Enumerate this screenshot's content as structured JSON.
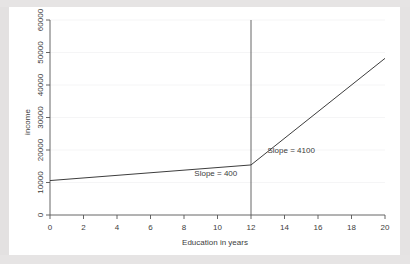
{
  "chart_data": {
    "type": "line",
    "title": "",
    "xlabel": "Education in years",
    "ylabel": "income",
    "xlim": [
      0,
      20
    ],
    "ylim": [
      0,
      60000
    ],
    "xticks": [
      0,
      2,
      4,
      6,
      8,
      10,
      12,
      14,
      16,
      18,
      20
    ],
    "xtick_labels": [
      "0",
      "2",
      "4",
      "6",
      "8",
      "10",
      "12",
      "14",
      "16",
      "18",
      "20"
    ],
    "yticks": [
      0,
      10000,
      20000,
      30000,
      40000,
      50000,
      60000
    ],
    "ytick_labels": [
      "0",
      "10000",
      "20000",
      "30000",
      "40000",
      "50000",
      "60000"
    ],
    "ytick_label_rotation": 90,
    "grid": "faint-horizontal",
    "legend": "none",
    "series": [
      {
        "name": "piecewise-income-spline",
        "color": "#3d3d3d",
        "x": [
          0,
          12,
          20
        ],
        "values": [
          10600,
          15400,
          48200
        ],
        "segments": [
          {
            "name": "pre-high-school",
            "x_from": 0,
            "x_to": 12,
            "slope": 400,
            "y_from": 10600,
            "y_to": 15400
          },
          {
            "name": "post-high-school",
            "x_from": 12,
            "x_to": 20,
            "slope": 4100,
            "y_from": 15400,
            "y_to": 48200
          }
        ]
      }
    ],
    "reference_lines": [
      {
        "name": "knot-at-12",
        "orientation": "vertical",
        "x": 12,
        "y_from": 0,
        "y_to": 62000,
        "color": "#555555"
      }
    ],
    "annotations": [
      {
        "name": "slope-low-label",
        "text": "Slope = 400",
        "x": 9.9,
        "y": 12000
      },
      {
        "name": "slope-high-label",
        "text": "Slope = 4100",
        "x": 14.4,
        "y": 19200
      }
    ]
  },
  "axes": {
    "x_title": "Education in years",
    "y_title": "income"
  }
}
